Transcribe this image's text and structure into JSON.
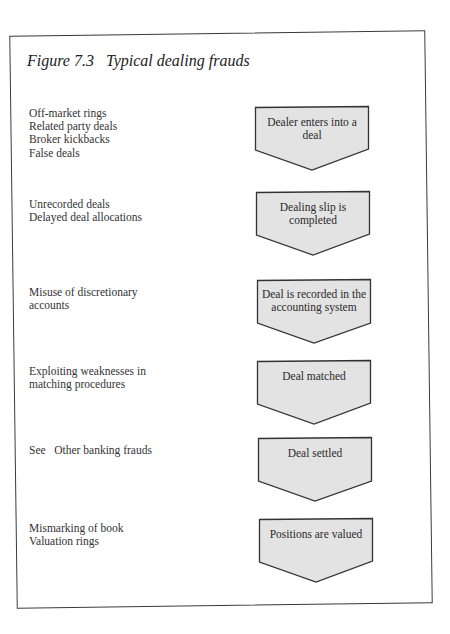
{
  "figure": {
    "title": "Figure 7.3   Typical dealing frauds"
  },
  "colors": {
    "box_fill": "#e3e3e3",
    "box_stroke": "#333333",
    "frame_stroke": "#3a3a3a"
  },
  "rows": [
    {
      "frauds": [
        "Off-market rings",
        "Related party deals",
        "Broker kickbacks",
        "False deals"
      ],
      "stage": "Dealer enters into a deal"
    },
    {
      "frauds": [
        "Unrecorded deals",
        "Delayed deal allocations"
      ],
      "stage": "Dealing slip is completed"
    },
    {
      "frauds": [
        "Misuse of discretionary",
        "accounts"
      ],
      "stage": "Deal is recorded in the accounting system"
    },
    {
      "frauds": [
        "Exploiting weaknesses in",
        "matching procedures"
      ],
      "stage": "Deal matched"
    },
    {
      "frauds": [
        "See   Other banking frauds"
      ],
      "stage": "Deal settled"
    },
    {
      "frauds": [
        "Mismarking of book",
        "Valuation rings"
      ],
      "stage": "Positions are valued"
    }
  ]
}
